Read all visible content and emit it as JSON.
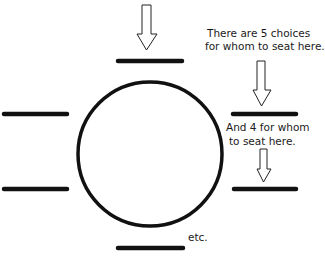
{
  "diagram": {
    "type": "round-table-seating",
    "table": {
      "shape": "circle"
    },
    "seats": [
      {
        "id": "top",
        "position": "top"
      },
      {
        "id": "right-upper",
        "position": "right-upper"
      },
      {
        "id": "right-lower",
        "position": "right-lower"
      },
      {
        "id": "bottom",
        "position": "bottom"
      },
      {
        "id": "left-lower",
        "position": "left-lower"
      },
      {
        "id": "left-upper",
        "position": "left-upper"
      }
    ],
    "arrows": [
      {
        "points_to": "top",
        "icon": "down-arrow-icon"
      },
      {
        "points_to": "right-upper",
        "icon": "down-arrow-icon"
      },
      {
        "points_to": "right-lower",
        "icon": "down-arrow-icon"
      }
    ],
    "annotations": {
      "first_choice": {
        "line1": "There are 5 choices",
        "line2": "for whom to seat here."
      },
      "second_choice": {
        "line1": "And 4 for whom",
        "line2": "to seat here."
      },
      "continuation": "etc."
    },
    "colors": {
      "stroke": "#111111",
      "background": "#ffffff"
    }
  }
}
